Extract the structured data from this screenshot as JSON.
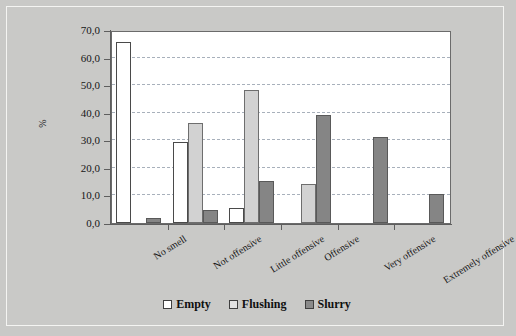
{
  "chart_data": {
    "type": "bar",
    "title": "",
    "subtitle": "",
    "xlabel": "",
    "ylabel": "%",
    "ylim": [
      0,
      70
    ],
    "ytick_step": 10,
    "ytick_labels": [
      "0,0",
      "10,0",
      "20,0",
      "30,0",
      "40,0",
      "50,0",
      "60,0",
      "70,0"
    ],
    "ytick_values": [
      0,
      10,
      20,
      30,
      40,
      50,
      60,
      70
    ],
    "grid": true,
    "grid_axis": "y",
    "legend_position": "bottom-center",
    "categories": [
      "No smell",
      "Not offensive",
      "Little offensive",
      "Offensive",
      "Very offensive",
      "Extremely offensive"
    ],
    "series": [
      {
        "name": "Empty",
        "color": "#ffffff",
        "values": [
          65.5,
          29.5,
          5.3,
          0,
          0,
          0
        ]
      },
      {
        "name": "Flushing",
        "color": "#d2d2d2",
        "values": [
          0,
          36.4,
          48.3,
          14.0,
          0,
          0
        ]
      },
      {
        "name": "Slurry",
        "color": "#858585",
        "values": [
          1.9,
          4.7,
          15.1,
          39.2,
          31.3,
          10.5
        ]
      }
    ]
  },
  "legend": {
    "items": [
      {
        "label": "Empty",
        "swatch": "empty"
      },
      {
        "label": "Flushing",
        "swatch": "flushing"
      },
      {
        "label": "Slurry",
        "swatch": "slurry"
      }
    ]
  },
  "axis": {
    "y_title": "%"
  },
  "colors": {
    "figure_background": "#c9c9c7",
    "plot_background": "#ffffff",
    "axis_line": "#5e5e5e",
    "gridline": "#9aa3b0",
    "empty": "#ffffff",
    "flushing": "#d2d2d2",
    "slurry": "#858585"
  }
}
